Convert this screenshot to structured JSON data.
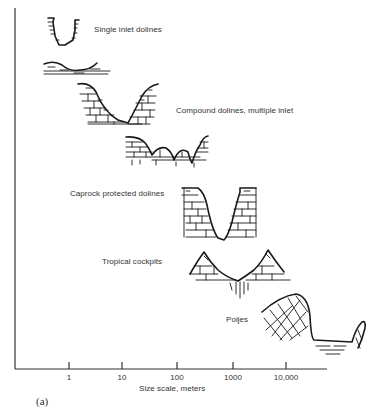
{
  "diagram": {
    "panel_label": "(a)",
    "x_axis": {
      "label": "Size scale, meters",
      "ticks": [
        "1",
        "10",
        "100",
        "1000",
        "10,000"
      ]
    },
    "features": [
      {
        "label": "Single inlet dolines"
      },
      {
        "label": "Compound dolines, multiple inlet"
      },
      {
        "label": "Caprock protected dolines"
      },
      {
        "label": "Tropical cockpits"
      },
      {
        "label": "Poljes"
      }
    ]
  }
}
